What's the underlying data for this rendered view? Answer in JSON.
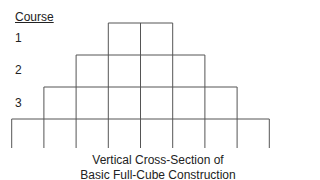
{
  "heading": "Course",
  "courses": [
    {
      "label": "1",
      "cubes": 2
    },
    {
      "label": "2",
      "cubes": 4
    },
    {
      "label": "3",
      "cubes": 6
    },
    {
      "label": "",
      "cubes": 8
    }
  ],
  "caption": {
    "line1": "Vertical Cross-Section of",
    "line2": "Basic Full-Cube Construction"
  },
  "colors": {
    "line": "#555555",
    "text": "#222222"
  }
}
